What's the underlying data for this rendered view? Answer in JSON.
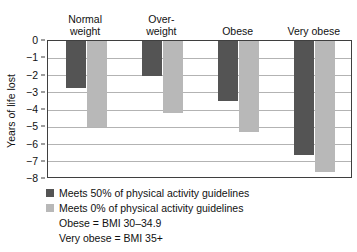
{
  "chart_data": {
    "type": "bar",
    "title": "",
    "xlabel": "",
    "ylabel": "Years of life lost",
    "ylim": [
      -8,
      0
    ],
    "yticks": [
      0,
      -1,
      -2,
      -3,
      -4,
      -5,
      -6,
      -7,
      -8
    ],
    "ytick_labels": [
      "0",
      "−1",
      "−2",
      "−3",
      "−4",
      "−5",
      "−6",
      "−7",
      "−8"
    ],
    "grid": true,
    "legend_position": "below-left",
    "categories": [
      "Normal\nweight",
      "Over-\nweight",
      "Obese",
      "Very obese"
    ],
    "series": [
      {
        "name": "Meets 50% of physical activity guidelines",
        "color": "#545454",
        "values": [
          -2.7,
          -2.0,
          -3.5,
          -6.6
        ]
      },
      {
        "name": "Meets 0% of physical activity guidelines",
        "color": "#b8b8b8",
        "values": [
          -5.0,
          -4.2,
          -5.3,
          -7.6
        ]
      }
    ],
    "annotations": [
      "Obese = BMI 30–34.9",
      "Very obese = BMI 35+"
    ]
  },
  "colors": {
    "series_dark": "#545454",
    "series_light": "#b8b8b8",
    "gridline": "#b3b3b3",
    "axis": "#3f3f3f",
    "text": "#111111",
    "background": "#ffffff"
  }
}
